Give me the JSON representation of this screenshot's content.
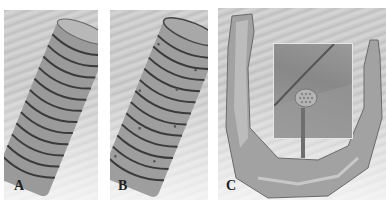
{
  "figure": {
    "panels": [
      {
        "id": "A",
        "label": "A",
        "description": "Threaded dental implant model (smooth)"
      },
      {
        "id": "B",
        "label": "B",
        "description": "Threaded dental implant model with porous surface"
      },
      {
        "id": "C",
        "label": "C",
        "description": "Mandible finite element mesh with implant inset and arrow"
      }
    ],
    "colors": {
      "implant": "#9a9a9a",
      "thread_shadow": "#3a3a3a",
      "bone": "#a8a8a8",
      "inset_border": "#e6e6e6",
      "arrow": "#6e6e6e"
    }
  }
}
